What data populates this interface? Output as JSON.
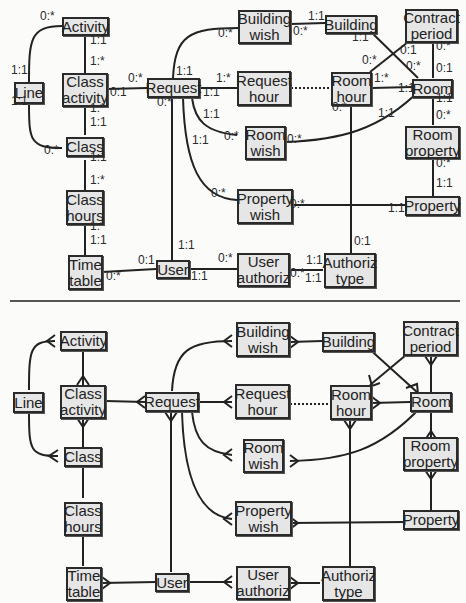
{
  "entities": {
    "activity": "Activity",
    "line": "Line",
    "class_activity": "Class\nactivity",
    "class": "Class",
    "class_hours": "Class\nhours",
    "time_table": "Time\ntable",
    "request": "Request",
    "user": "User",
    "building_wish": "Building\nwish",
    "request_hour": "Request\nhour",
    "room_wish": "Room\nwish",
    "property_wish": "Property\nwish",
    "user_authoriz": "User\nauthoriz",
    "building": "Building",
    "room_hour": "Room\nhour",
    "authoriz_type": "Authoriz\ntype",
    "contract_period": "Contract\nperiod",
    "room": "Room",
    "room_property": "Room\nproperty",
    "property": "Property"
  },
  "top_diagram": {
    "notation": "min:max cardinality",
    "cardinalities": [
      {
        "label": "0:*",
        "x": 40,
        "y": 16
      },
      {
        "label": "1:1",
        "x": 90,
        "y": 40
      },
      {
        "label": "1:*",
        "x": 90,
        "y": 61
      },
      {
        "label": "1:1",
        "x": 11,
        "y": 70
      },
      {
        "label": "1:1",
        "x": 11,
        "y": 101
      },
      {
        "label": "0:*",
        "x": 128,
        "y": 78
      },
      {
        "label": "0:1",
        "x": 110,
        "y": 92
      },
      {
        "label": "1:*",
        "x": 90,
        "y": 108
      },
      {
        "label": "1:1",
        "x": 90,
        "y": 122
      },
      {
        "label": "0:*",
        "x": 44,
        "y": 150
      },
      {
        "label": "1:1",
        "x": 90,
        "y": 157
      },
      {
        "label": "1:*",
        "x": 90,
        "y": 180
      },
      {
        "label": "1:*",
        "x": 90,
        "y": 226
      },
      {
        "label": "1:1",
        "x": 90,
        "y": 240
      },
      {
        "label": "0:*",
        "x": 106,
        "y": 276
      },
      {
        "label": "0:1",
        "x": 138,
        "y": 260
      },
      {
        "label": "1:1",
        "x": 176,
        "y": 71
      },
      {
        "label": "0:*",
        "x": 157,
        "y": 102
      },
      {
        "label": "1:*",
        "x": 216,
        "y": 78
      },
      {
        "label": "1:1",
        "x": 203,
        "y": 92
      },
      {
        "label": "1:1",
        "x": 203,
        "y": 114
      },
      {
        "label": "1:1",
        "x": 192,
        "y": 140
      },
      {
        "label": "0:*",
        "x": 224,
        "y": 136
      },
      {
        "label": "0:*",
        "x": 218,
        "y": 33
      },
      {
        "label": "1:1",
        "x": 178,
        "y": 245
      },
      {
        "label": "1:1",
        "x": 191,
        "y": 276
      },
      {
        "label": "0:*",
        "x": 218,
        "y": 258
      },
      {
        "label": "0:*",
        "x": 211,
        "y": 193
      },
      {
        "label": "0:*",
        "x": 290,
        "y": 204
      },
      {
        "label": "0:*",
        "x": 290,
        "y": 273
      },
      {
        "label": "1:1",
        "x": 306,
        "y": 260
      },
      {
        "label": "0:*",
        "x": 293,
        "y": 31
      },
      {
        "label": "1:1",
        "x": 308,
        "y": 16
      },
      {
        "label": "1:1",
        "x": 352,
        "y": 37
      },
      {
        "label": "0:*",
        "x": 362,
        "y": 60
      },
      {
        "label": "0:*",
        "x": 332,
        "y": 107
      },
      {
        "label": "1:*",
        "x": 374,
        "y": 78
      },
      {
        "label": "1:1",
        "x": 398,
        "y": 88
      },
      {
        "label": "1:1",
        "x": 378,
        "y": 113
      },
      {
        "label": "0:*",
        "x": 287,
        "y": 139
      },
      {
        "label": "0:1",
        "x": 400,
        "y": 50
      },
      {
        "label": "0:*",
        "x": 406,
        "y": 66
      },
      {
        "label": "0:*",
        "x": 436,
        "y": 46
      },
      {
        "label": "0:1",
        "x": 436,
        "y": 68
      },
      {
        "label": "1:1",
        "x": 436,
        "y": 98
      },
      {
        "label": "0:*",
        "x": 436,
        "y": 115
      },
      {
        "label": "0:*",
        "x": 436,
        "y": 163
      },
      {
        "label": "1:1",
        "x": 436,
        "y": 183
      },
      {
        "label": "1:1",
        "x": 388,
        "y": 208
      },
      {
        "label": "0:1",
        "x": 354,
        "y": 241
      },
      {
        "label": "1:1",
        "x": 305,
        "y": 278
      }
    ]
  },
  "bottom_diagram": {
    "notation": "crow's foot"
  }
}
